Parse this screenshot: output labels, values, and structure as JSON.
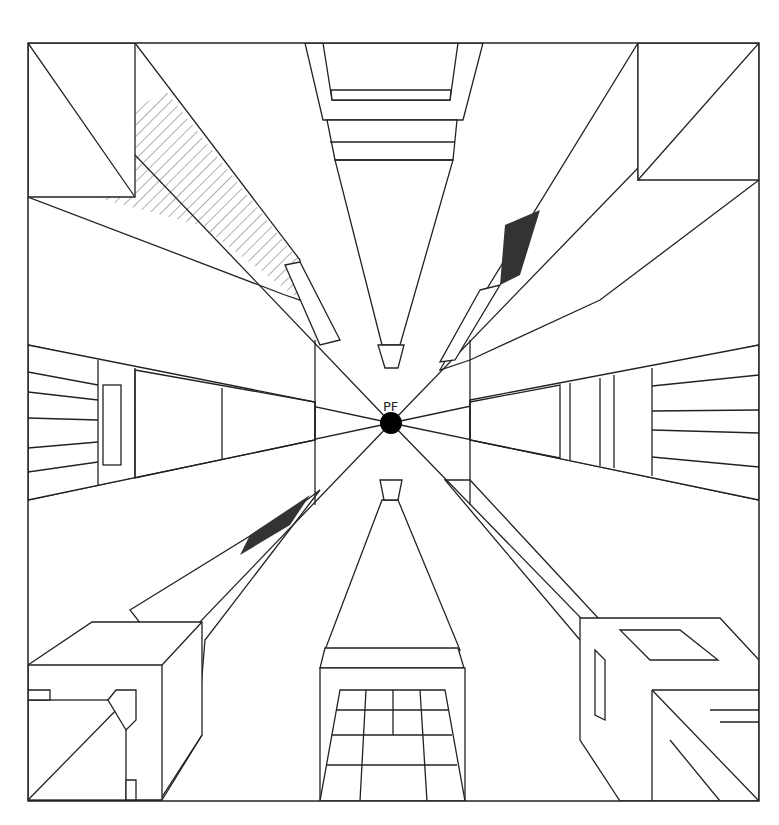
{
  "vanishing_point": {
    "label": "PF",
    "x": 391,
    "y": 423,
    "radius": 11
  },
  "frame": {
    "x": 28,
    "y": 43,
    "width": 731,
    "height": 758
  },
  "colors": {
    "line": "#222222",
    "background": "#ffffff",
    "dot": "#000000"
  },
  "buildings": [
    {
      "name": "top-left-tower",
      "position": "upper-left"
    },
    {
      "name": "top-center-tower",
      "position": "top"
    },
    {
      "name": "top-right-tower",
      "position": "upper-right"
    },
    {
      "name": "left-middle-building",
      "position": "left"
    },
    {
      "name": "right-middle-building",
      "position": "right"
    },
    {
      "name": "bottom-left-tower",
      "position": "lower-left"
    },
    {
      "name": "bottom-center-tower",
      "position": "bottom"
    },
    {
      "name": "bottom-right-tower",
      "position": "lower-right"
    }
  ]
}
